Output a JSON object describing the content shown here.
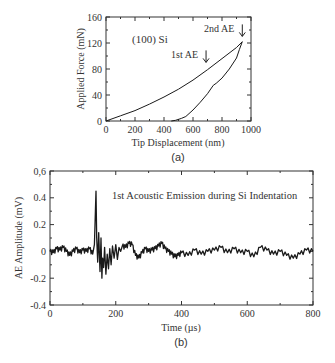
{
  "chart_data": [
    {
      "type": "line",
      "caption": "(a)",
      "annotation": "(100) Si",
      "xlabel": "Tip Displacement (nm)",
      "ylabel": "Applied Force (mN)",
      "xlim": [
        0,
        1000
      ],
      "ylim": [
        0,
        160
      ],
      "xticks": [
        "0",
        "200",
        "400",
        "600",
        "800",
        "1000"
      ],
      "yticks": [
        "0",
        "40",
        "80",
        "120",
        "160"
      ],
      "arrows": [
        {
          "label": "1st AE",
          "x": 690,
          "y": 84
        },
        {
          "label": "2nd AE",
          "x": 940,
          "y": 124
        }
      ],
      "series": [
        {
          "name": "loading",
          "x": [
            0,
            100,
            200,
            300,
            400,
            500,
            600,
            700,
            800,
            900,
            940
          ],
          "y": [
            0,
            8,
            16,
            26,
            37,
            49,
            63,
            79,
            96,
            113,
            122
          ]
        },
        {
          "name": "unloading",
          "x": [
            940,
            920,
            900,
            850,
            800,
            760,
            740,
            700,
            650,
            600,
            550,
            520,
            480,
            450
          ],
          "y": [
            122,
            110,
            97,
            80,
            66,
            58,
            55,
            42,
            29,
            17,
            7,
            4,
            1,
            0
          ]
        }
      ]
    },
    {
      "type": "line",
      "caption": "(b)",
      "title": "1st Acoustic Emission during Si Indentation",
      "xlabel": "Time (µs)",
      "ylabel": "AE Amplitude (mV)",
      "xlim": [
        0,
        800
      ],
      "ylim": [
        -0.4,
        0.6
      ],
      "xticks": [
        "0",
        "200",
        "400",
        "600",
        "800"
      ],
      "yticks": [
        "-0.4",
        "-0.2",
        "0",
        "0.2",
        "0.4",
        "0,6"
      ],
      "series": [
        {
          "name": "AE signal",
          "x": [
            0,
            10,
            20,
            30,
            40,
            50,
            60,
            70,
            80,
            90,
            100,
            110,
            120,
            130,
            135,
            138,
            140,
            142,
            145,
            148,
            150,
            152,
            155,
            158,
            160,
            163,
            166,
            170,
            174,
            178,
            182,
            186,
            190,
            195,
            200,
            205,
            210,
            215,
            220,
            230,
            240,
            250,
            260,
            270,
            280,
            290,
            300,
            310,
            320,
            330,
            340,
            350,
            360,
            370,
            380,
            390,
            400,
            420,
            440,
            460,
            480,
            500,
            520,
            540,
            560,
            580,
            600,
            620,
            640,
            660,
            680,
            700,
            720,
            740,
            760,
            780,
            800
          ],
          "y": [
            0.0,
            -0.01,
            0.02,
            0.01,
            0.03,
            0.0,
            -0.03,
            0.0,
            0.02,
            -0.01,
            0.01,
            0.0,
            0.02,
            -0.02,
            0.05,
            0.3,
            0.45,
            0.1,
            -0.08,
            0.14,
            0.0,
            -0.15,
            0.1,
            -0.2,
            -0.05,
            -0.12,
            0.03,
            -0.17,
            -0.02,
            -0.13,
            0.02,
            -0.1,
            0.04,
            -0.05,
            0.05,
            -0.06,
            0.03,
            0.0,
            0.04,
            0.03,
            0.06,
            0.05,
            -0.03,
            -0.05,
            -0.01,
            0.02,
            0.0,
            0.01,
            0.02,
            0.04,
            0.06,
            0.02,
            0.0,
            -0.02,
            -0.04,
            -0.03,
            -0.01,
            -0.03,
            0.01,
            -0.02,
            0.0,
            0.01,
            0.03,
            -0.01,
            0.02,
            -0.01,
            0.0,
            -0.04,
            0.03,
            0.01,
            -0.02,
            0.0,
            -0.03,
            -0.05,
            -0.02,
            0.01,
            0.0
          ]
        }
      ]
    }
  ]
}
